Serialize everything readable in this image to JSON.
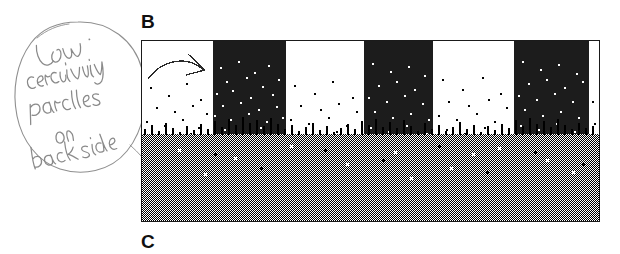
{
  "figure": {
    "background_color": "#ffffff",
    "panel_labels": [
      {
        "id": "B",
        "text": "B",
        "x": 141,
        "y": 12
      },
      {
        "id": "C",
        "text": "C",
        "x": 141,
        "y": 232
      }
    ]
  },
  "annotation": {
    "type": "handwritten-note",
    "text": "Low coercivity particles on back side",
    "lines": [
      "Low",
      "coercivity",
      "particles",
      "on",
      "back side"
    ],
    "ink_color": "#8a8a8a",
    "enclosure_shape": "ellipse",
    "has_leader_arrow": true,
    "arrow_direction": "right"
  },
  "micrograph": {
    "label": "B",
    "frame": {
      "x": 141,
      "y": 40,
      "width": 459,
      "height": 182
    },
    "border_color": "#1a1a1a",
    "colors": {
      "domain_dark": "#1c1c1c",
      "domain_light": "#ffffff",
      "substrate_gray": "#808080",
      "particle_dark": "#000000",
      "particle_light": "#ffffff"
    },
    "domain_bands": [
      {
        "index": 0,
        "polarity": "light",
        "x0": 0,
        "x1": 71
      },
      {
        "index": 1,
        "polarity": "dark",
        "x0": 71,
        "x1": 144
      },
      {
        "index": 2,
        "polarity": "light",
        "x0": 144,
        "x1": 222
      },
      {
        "index": 3,
        "polarity": "dark",
        "x0": 222,
        "x1": 291
      },
      {
        "index": 4,
        "polarity": "light",
        "x0": 291,
        "x1": 372
      },
      {
        "index": 5,
        "polarity": "dark",
        "x0": 372,
        "x1": 447
      },
      {
        "index": 6,
        "polarity": "light",
        "x0": 447,
        "x1": 459
      }
    ],
    "substrate": {
      "pattern": "checkerboard-dither",
      "cell_size_px": 1,
      "top_y": 93,
      "bottom_y": 182,
      "apparent_gray": "#808080"
    },
    "particle_layer": {
      "description": "scattered magnetic particles, density increasing toward substrate",
      "top_y": 18,
      "transition_y": 93
    },
    "inset_arrow": {
      "present": true,
      "description": "hand-drawn arrow pointing right",
      "x": 10,
      "y": 18
    }
  }
}
